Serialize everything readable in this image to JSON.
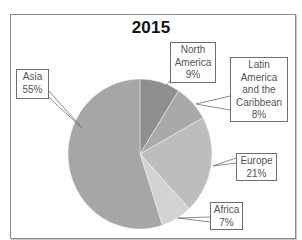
{
  "chart_data": {
    "type": "pie",
    "title": "2015",
    "start_angle_deg": 0,
    "direction": "clockwise",
    "slices": [
      {
        "name": "North America",
        "label_lines": [
          "North",
          "America"
        ],
        "value": 9,
        "value_label": "9%",
        "color": "#8e8e8e"
      },
      {
        "name": "Latin America and the Caribbean",
        "label_lines": [
          "Latin",
          "America",
          "and the",
          "Caribbean"
        ],
        "value": 8,
        "value_label": "8%",
        "color": "#a9a9a9"
      },
      {
        "name": "Europe",
        "label_lines": [
          "Europe"
        ],
        "value": 21,
        "value_label": "21%",
        "color": "#bdbdbd"
      },
      {
        "name": "Africa",
        "label_lines": [
          "Africa"
        ],
        "value": 7,
        "value_label": "7%",
        "color": "#d3d3d3"
      },
      {
        "name": "Asia",
        "label_lines": [
          "Asia"
        ],
        "value": 55,
        "value_label": "55%",
        "color": "#a6a6a6"
      }
    ],
    "legend": "none",
    "labels": "callout boxes with leader lines"
  }
}
